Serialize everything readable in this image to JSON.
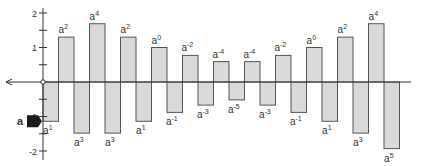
{
  "chart_data": {
    "type": "bar",
    "title": "",
    "base": 1.14,
    "base_label": "a",
    "categories": [
      "a^1",
      "a^2",
      "a^3",
      "a^4",
      "a^3",
      "a^2",
      "a^1",
      "a^0",
      "a^-1",
      "a^-2",
      "a^-3",
      "a^-4",
      "a^-5",
      "a^-4",
      "a^-3",
      "a^-2",
      "a^-1",
      "a^0",
      "a^1",
      "a^2",
      "a^3",
      "a^4",
      "a^5"
    ],
    "exponents": [
      1,
      2,
      3,
      4,
      3,
      2,
      1,
      0,
      -1,
      -2,
      -3,
      -4,
      -5,
      -4,
      -3,
      -2,
      -1,
      0,
      1,
      2,
      3,
      4,
      5
    ],
    "directions": [
      "down",
      "up",
      "down",
      "up",
      "down",
      "up",
      "down",
      "up",
      "down",
      "up",
      "down",
      "up",
      "down",
      "up",
      "down",
      "up",
      "down",
      "up",
      "down",
      "up",
      "down",
      "up",
      "down"
    ],
    "values": [
      -1.14,
      1.3,
      -1.48,
      1.69,
      -1.48,
      1.3,
      -1.14,
      1.0,
      -0.88,
      0.77,
      -0.67,
      0.59,
      -0.52,
      0.59,
      -0.67,
      0.77,
      -0.88,
      1.0,
      -1.14,
      1.3,
      -1.48,
      1.69,
      -1.93
    ],
    "ylim": [
      -2,
      2
    ],
    "yticks": [
      2,
      1,
      -1,
      -2
    ],
    "ytick_labels": [
      "2",
      "1",
      "1",
      "-2"
    ],
    "minor_ytick_step": 0.5,
    "grid": false,
    "legend": null,
    "colors": {
      "bar_fill": "#d9d9d9",
      "bar_stroke": "#555555",
      "axis": "#333333",
      "marker": "#1a1a1a"
    }
  },
  "labels": {
    "bars": [
      {
        "base": "a",
        "exp": "1"
      },
      {
        "base": "a",
        "exp": "2"
      },
      {
        "base": "a",
        "exp": "3"
      },
      {
        "base": "a",
        "exp": "4"
      },
      {
        "base": "a",
        "exp": "3"
      },
      {
        "base": "a",
        "exp": "2"
      },
      {
        "base": "a",
        "exp": "1"
      },
      {
        "base": "a",
        "exp": "0"
      },
      {
        "base": "a",
        "exp": "-1"
      },
      {
        "base": "a",
        "exp": "-2"
      },
      {
        "base": "a",
        "exp": "-3"
      },
      {
        "base": "a",
        "exp": "-4"
      },
      {
        "base": "a",
        "exp": "-5"
      },
      {
        "base": "a",
        "exp": "-4"
      },
      {
        "base": "a",
        "exp": "-3"
      },
      {
        "base": "a",
        "exp": "-2"
      },
      {
        "base": "a",
        "exp": "-1"
      },
      {
        "base": "a",
        "exp": "0"
      },
      {
        "base": "a",
        "exp": "1"
      },
      {
        "base": "a",
        "exp": "2"
      },
      {
        "base": "a",
        "exp": "3"
      },
      {
        "base": "a",
        "exp": "4"
      },
      {
        "base": "a",
        "exp": "5"
      }
    ],
    "marker_label": "a"
  }
}
